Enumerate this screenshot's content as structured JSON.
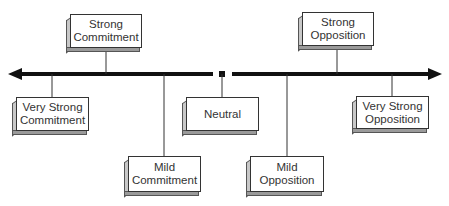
{
  "diagram": {
    "title": "",
    "axis": {
      "description": "Continuum from commitment (left) to opposition (right)",
      "left_arrow": true,
      "right_arrow": true,
      "center_marker": "neutral point"
    },
    "nodes": [
      {
        "id": "strong-commitment",
        "lines": [
          "Strong",
          "Commitment"
        ],
        "position": "above"
      },
      {
        "id": "strong-opposition",
        "lines": [
          "Strong",
          "Opposition"
        ],
        "position": "above"
      },
      {
        "id": "very-strong-commitment",
        "lines": [
          "Very Strong",
          "Commitment"
        ],
        "position": "below"
      },
      {
        "id": "neutral",
        "lines": [
          "Neutral"
        ],
        "position": "below"
      },
      {
        "id": "very-strong-opposition",
        "lines": [
          "Very Strong",
          "Opposition"
        ],
        "position": "below"
      },
      {
        "id": "mild-commitment",
        "lines": [
          "Mild",
          "Commitment"
        ],
        "position": "below-far"
      },
      {
        "id": "mild-opposition",
        "lines": [
          "Mild",
          "Opposition"
        ],
        "position": "below-far"
      }
    ],
    "colors": {
      "line": "#111111",
      "box_face": "#ffffff",
      "box_shadow": "#9a9a9a",
      "text": "#333333"
    }
  }
}
